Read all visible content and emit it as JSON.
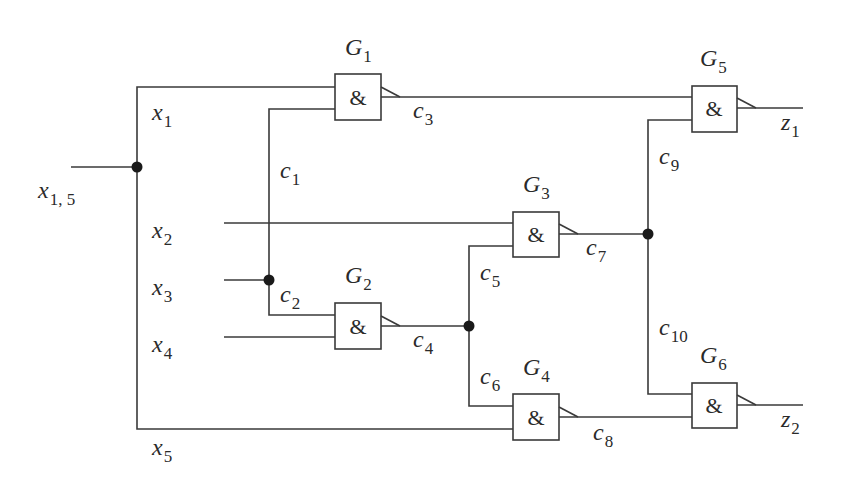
{
  "diagram": {
    "type": "combinational-logic-circuit",
    "gate_symbol": "&",
    "colors": {
      "line": "#3a3a3a",
      "junction": "#1a1a1a",
      "background": "#ffffff"
    },
    "gates": [
      {
        "id": "G1",
        "letter": "G",
        "index": "1",
        "symbol": "&",
        "inputs": [
          "x1",
          "c1"
        ],
        "output": "c3"
      },
      {
        "id": "G2",
        "letter": "G",
        "index": "2",
        "symbol": "&",
        "inputs": [
          "c2",
          "x4"
        ],
        "output": "c4"
      },
      {
        "id": "G3",
        "letter": "G",
        "index": "3",
        "symbol": "&",
        "inputs": [
          "x2",
          "c5"
        ],
        "output": "c7"
      },
      {
        "id": "G4",
        "letter": "G",
        "index": "4",
        "symbol": "&",
        "inputs": [
          "c6",
          "x5"
        ],
        "output": "c8"
      },
      {
        "id": "G5",
        "letter": "G",
        "index": "5",
        "symbol": "&",
        "inputs": [
          "c3",
          "c9"
        ],
        "output": "z1"
      },
      {
        "id": "G6",
        "letter": "G",
        "index": "6",
        "symbol": "&",
        "inputs": [
          "c10",
          "c8"
        ],
        "output": "z2"
      }
    ],
    "signals": {
      "x15": {
        "letter": "x",
        "index": "1, 5"
      },
      "x1": {
        "letter": "x",
        "index": "1"
      },
      "x2": {
        "letter": "x",
        "index": "2"
      },
      "x3": {
        "letter": "x",
        "index": "3"
      },
      "x4": {
        "letter": "x",
        "index": "4"
      },
      "x5": {
        "letter": "x",
        "index": "5"
      },
      "c1": {
        "letter": "c",
        "index": "1"
      },
      "c2": {
        "letter": "c",
        "index": "2"
      },
      "c3": {
        "letter": "c",
        "index": "3"
      },
      "c4": {
        "letter": "c",
        "index": "4"
      },
      "c5": {
        "letter": "c",
        "index": "5"
      },
      "c6": {
        "letter": "c",
        "index": "6"
      },
      "c7": {
        "letter": "c",
        "index": "7"
      },
      "c8": {
        "letter": "c",
        "index": "8"
      },
      "c9": {
        "letter": "c",
        "index": "9"
      },
      "c10": {
        "letter": "c",
        "index": "10"
      },
      "z1": {
        "letter": "z",
        "index": "1"
      },
      "z2": {
        "letter": "z",
        "index": "2"
      }
    },
    "fanout_points": [
      {
        "stem": "x1,5",
        "branches": [
          "x1",
          "x5"
        ]
      },
      {
        "stem": "x3",
        "branches": [
          "c1",
          "c2"
        ]
      },
      {
        "stem": "c4",
        "branches": [
          "c5",
          "c6"
        ]
      },
      {
        "stem": "c7",
        "branches": [
          "c9",
          "c10"
        ]
      }
    ],
    "primary_inputs": [
      "x1,5",
      "x2",
      "x3",
      "x4"
    ],
    "primary_outputs": [
      "z1",
      "z2"
    ]
  }
}
